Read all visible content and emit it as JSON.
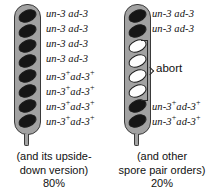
{
  "figure": {
    "colors": {
      "ascus_fill": "#a2a2a2",
      "ascus_outline": "#3a3a3a",
      "spore_dark": "#161616",
      "spore_white": "#fdfdfd",
      "text": "#111111",
      "background": "#ffffff"
    }
  },
  "asci": [
    {
      "id": "left-ascus",
      "spore_count": 8,
      "spores": [
        {
          "index": 1,
          "color": "dark",
          "label_main": "un-3 ad-3",
          "un_sup": "",
          "ad_sup": ""
        },
        {
          "index": 2,
          "color": "dark",
          "label_main": "un-3 ad-3",
          "un_sup": "",
          "ad_sup": ""
        },
        {
          "index": 3,
          "color": "dark",
          "label_main": "un-3 ad-3",
          "un_sup": "",
          "ad_sup": ""
        },
        {
          "index": 4,
          "color": "dark",
          "label_main": "un-3 ad-3",
          "un_sup": "",
          "ad_sup": ""
        },
        {
          "index": 5,
          "color": "dark",
          "label_main": "un-3 ad-3",
          "un_sup": "+",
          "ad_sup": "+"
        },
        {
          "index": 6,
          "color": "dark",
          "label_main": "un-3 ad-3",
          "un_sup": "+",
          "ad_sup": "+"
        },
        {
          "index": 7,
          "color": "dark",
          "label_main": "un-3 ad-3",
          "un_sup": "+",
          "ad_sup": "+"
        },
        {
          "index": 8,
          "color": "dark",
          "label_main": "un-3 ad-3",
          "un_sup": "+",
          "ad_sup": "+"
        }
      ],
      "caption_line1": "(and its upside-",
      "caption_line2": "down version)",
      "percentage": "80%"
    },
    {
      "id": "right-ascus",
      "spore_count": 8,
      "spores": [
        {
          "index": 1,
          "color": "dark",
          "label_main": "un-3 ad-3",
          "un_sup": "",
          "ad_sup": ""
        },
        {
          "index": 2,
          "color": "dark",
          "label_main": "un-3 ad-3",
          "un_sup": "",
          "ad_sup": ""
        },
        {
          "index": 3,
          "color": "white",
          "label_main": "",
          "un_sup": "",
          "ad_sup": ""
        },
        {
          "index": 4,
          "color": "white",
          "label_main": "",
          "un_sup": "",
          "ad_sup": ""
        },
        {
          "index": 5,
          "color": "white",
          "label_main": "",
          "un_sup": "",
          "ad_sup": ""
        },
        {
          "index": 6,
          "color": "white",
          "label_main": "",
          "un_sup": "",
          "ad_sup": ""
        },
        {
          "index": 7,
          "color": "dark",
          "label_main": "un-3 ad-3",
          "un_sup": "+",
          "ad_sup": "+"
        },
        {
          "index": 8,
          "color": "dark",
          "label_main": "un-3 ad-3",
          "un_sup": "+",
          "ad_sup": "+"
        }
      ],
      "bracket_label": "abort",
      "caption_line1": "(and other",
      "caption_line2": "spore pair orders)",
      "percentage": "20%"
    }
  ]
}
